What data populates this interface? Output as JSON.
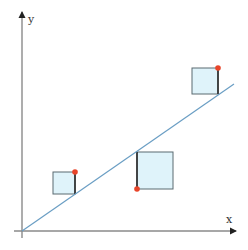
{
  "diagram": {
    "type": "least-squares-residual-squares",
    "axes": {
      "x_label": "x",
      "y_label": "y",
      "color": "#777777"
    },
    "regression_line": {
      "color": "#6a9ec4"
    },
    "squares": [
      {
        "id": "left",
        "fill": "#dff3fa",
        "stroke": "#5a6a70",
        "point_position": "above-line"
      },
      {
        "id": "middle",
        "fill": "#dff3fa",
        "stroke": "#5a6a70",
        "point_position": "below-line"
      },
      {
        "id": "right",
        "fill": "#dff3fa",
        "stroke": "#5a6a70",
        "point_position": "above-line"
      }
    ],
    "point_color": "#e8452a"
  }
}
